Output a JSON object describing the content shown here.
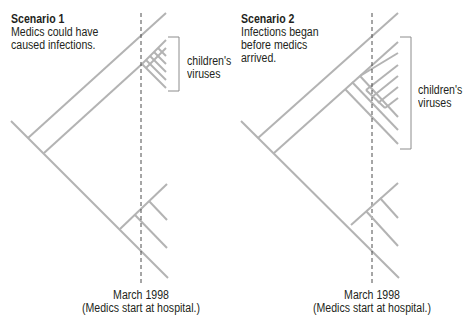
{
  "colors": {
    "branch": "#b3b3b3",
    "dashed": "#4d4d4d",
    "bracket": "#8c8c8c",
    "text": "#231f20"
  },
  "scenario1": {
    "title": "Scenario 1",
    "description_lines": [
      "Medics could have",
      "caused infections."
    ],
    "cluster_label_lines": [
      "children's",
      "viruses"
    ],
    "timeline_label": "March 1998",
    "timeline_sublabel": "(Medics start at hospital.)"
  },
  "scenario2": {
    "title": "Scenario 2",
    "description_lines": [
      "Infections began",
      "before medics",
      "arrived."
    ],
    "cluster_label_lines": [
      "children's",
      "viruses"
    ],
    "timeline_label": "March 1998",
    "timeline_sublabel": "(Medics start at hospital.)"
  }
}
